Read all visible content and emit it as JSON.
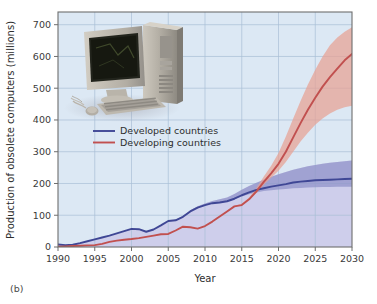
{
  "figure": {
    "panel_label": "(b)",
    "background_color": "#ffffff",
    "plot_upper_bg": "#dce8f4",
    "plot_lower_bg": "#ccccea",
    "grid_color": "#a9bed6",
    "frame_color": "#6e6e6e",
    "photo": {
      "name": "desktop-computer-photo",
      "description": "Photograph of a beige desktop computer with CRT monitor, tower case, keyboard and mouse",
      "case_color": "#b9b4aa",
      "screen_color": "#1a1c14",
      "shadow_color": "#9a9a9e"
    }
  },
  "chart_data": {
    "type": "line",
    "title": "",
    "xlabel": "Year",
    "ylabel": "Production of obsolete computers (millions)",
    "xlim": [
      1990,
      2030
    ],
    "ylim": [
      0,
      740
    ],
    "xticks": [
      1990,
      1995,
      2000,
      2005,
      2010,
      2015,
      2020,
      2025,
      2030
    ],
    "yticks": [
      0,
      100,
      200,
      300,
      400,
      500,
      600,
      700
    ],
    "grid": true,
    "legend_position": "upper-left",
    "x": [
      1990,
      1991,
      1992,
      1993,
      1994,
      1995,
      1996,
      1997,
      1998,
      1999,
      2000,
      2001,
      2002,
      2003,
      2004,
      2005,
      2006,
      2007,
      2008,
      2009,
      2010,
      2011,
      2012,
      2013,
      2014,
      2015,
      2016,
      2017,
      2018,
      2019,
      2020,
      2021,
      2022,
      2023,
      2024,
      2025,
      2026,
      2027,
      2028,
      2029,
      2030
    ],
    "series": [
      {
        "name": "Developed countries",
        "color": "#3f4795",
        "band_color": "#8f92c8",
        "band_opacity": 0.72,
        "values": [
          8,
          6,
          7,
          12,
          18,
          24,
          30,
          36,
          43,
          50,
          57,
          56,
          48,
          55,
          68,
          82,
          84,
          95,
          112,
          124,
          132,
          138,
          140,
          144,
          152,
          163,
          172,
          180,
          185,
          190,
          194,
          198,
          203,
          206,
          208,
          210,
          211,
          212,
          213,
          214,
          215
        ],
        "band_low": [
          8,
          6,
          7,
          12,
          18,
          24,
          30,
          36,
          43,
          50,
          57,
          56,
          48,
          55,
          68,
          82,
          84,
          95,
          112,
          124,
          132,
          138,
          140,
          144,
          150,
          159,
          166,
          172,
          176,
          179,
          181,
          183,
          185,
          186,
          187,
          188,
          189,
          189,
          190,
          190,
          190
        ],
        "band_high": [
          8,
          6,
          7,
          12,
          18,
          24,
          30,
          36,
          43,
          50,
          57,
          56,
          48,
          55,
          68,
          82,
          86,
          98,
          116,
          128,
          137,
          145,
          150,
          156,
          167,
          180,
          192,
          202,
          212,
          221,
          229,
          236,
          243,
          249,
          254,
          258,
          262,
          265,
          268,
          270,
          272
        ]
      },
      {
        "name": "Developing countries",
        "color": "#c1504f",
        "band_color": "#e8a193",
        "band_opacity": 0.72,
        "values": [
          1,
          2,
          3,
          4,
          5,
          6,
          10,
          16,
          20,
          23,
          25,
          28,
          32,
          36,
          40,
          41,
          52,
          64,
          62,
          58,
          66,
          80,
          96,
          112,
          128,
          132,
          150,
          175,
          205,
          232,
          262,
          300,
          345,
          390,
          432,
          470,
          505,
          535,
          562,
          588,
          608
        ],
        "band_low": [
          1,
          2,
          3,
          4,
          5,
          6,
          10,
          16,
          20,
          23,
          25,
          28,
          32,
          36,
          40,
          41,
          52,
          64,
          62,
          58,
          66,
          80,
          96,
          112,
          128,
          132,
          148,
          170,
          196,
          218,
          240,
          268,
          300,
          332,
          360,
          385,
          405,
          420,
          432,
          440,
          445
        ],
        "band_high": [
          1,
          2,
          3,
          4,
          5,
          6,
          10,
          16,
          20,
          23,
          25,
          28,
          32,
          36,
          40,
          41,
          52,
          64,
          62,
          58,
          66,
          80,
          96,
          114,
          130,
          136,
          156,
          186,
          222,
          256,
          296,
          348,
          405,
          460,
          512,
          558,
          600,
          635,
          660,
          678,
          692
        ]
      }
    ]
  }
}
